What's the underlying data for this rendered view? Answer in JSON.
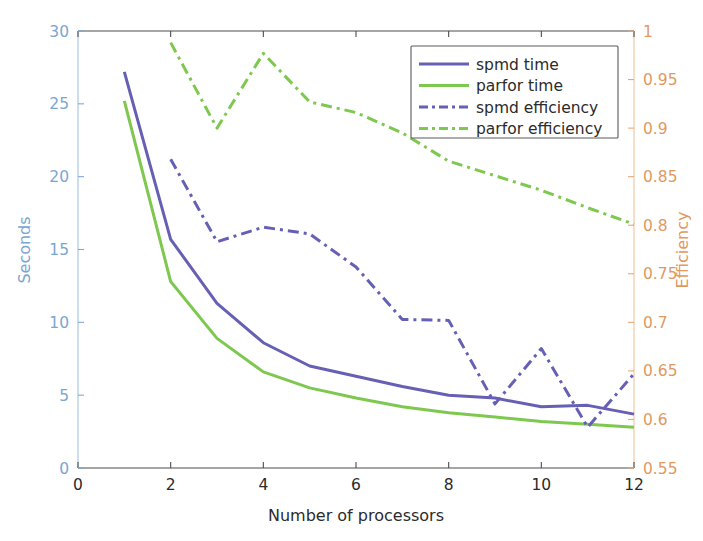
{
  "chart_data": {
    "type": "line",
    "title": "",
    "xlabel": "Number of processors",
    "ylabel": "Seconds",
    "y2label": "Efficiency",
    "xlim": [
      0,
      12
    ],
    "ylim": [
      0,
      30
    ],
    "y2lim": [
      0.55,
      1.0
    ],
    "xticks": [
      "0",
      "2",
      "4",
      "6",
      "8",
      "10",
      "12"
    ],
    "xtick_values": [
      0,
      2,
      4,
      6,
      8,
      10,
      12
    ],
    "yticks": [
      "0",
      "5",
      "10",
      "15",
      "20",
      "25",
      "30"
    ],
    "ytick_values": [
      0,
      5,
      10,
      15,
      20,
      25,
      30
    ],
    "y2ticks": [
      "0.55",
      "0.6",
      "0.65",
      "0.7",
      "0.75",
      "0.8",
      "0.85",
      "0.9",
      "0.95",
      "1"
    ],
    "y2tick_values": [
      0.55,
      0.6,
      0.65,
      0.7,
      0.75,
      0.8,
      0.85,
      0.9,
      0.95,
      1.0
    ],
    "grid": false,
    "legend_position": "top-right",
    "colors": {
      "spmd": "#6660b4",
      "parfor": "#7ec850",
      "left_axis": "#7aa6d2",
      "right_axis": "#e2995f"
    },
    "series": [
      {
        "name": "spmd time",
        "axis": "left",
        "style": "solid",
        "color": "#6660b4",
        "x": [
          1,
          2,
          3,
          4,
          5,
          6,
          7,
          8,
          9,
          10,
          11,
          12
        ],
        "values": [
          27.2,
          15.7,
          11.3,
          8.6,
          7.0,
          6.3,
          5.6,
          5.0,
          4.8,
          4.2,
          4.3,
          3.7
        ]
      },
      {
        "name": "parfor time",
        "axis": "left",
        "style": "solid",
        "color": "#7ec850",
        "x": [
          1,
          2,
          3,
          4,
          5,
          6,
          7,
          8,
          9,
          10,
          11,
          12
        ],
        "values": [
          25.2,
          12.8,
          8.9,
          6.6,
          5.5,
          4.8,
          4.2,
          3.8,
          3.5,
          3.2,
          3.0,
          2.8
        ]
      },
      {
        "name": "spmd efficiency",
        "axis": "right",
        "style": "dashdot",
        "color": "#6660b4",
        "x": [
          2,
          3,
          4,
          5,
          6,
          7,
          8,
          9,
          10,
          11,
          12
        ],
        "values": [
          0.868,
          0.783,
          0.798,
          0.791,
          0.757,
          0.703,
          0.702,
          0.616,
          0.673,
          0.592,
          0.647
        ]
      },
      {
        "name": "parfor efficiency",
        "axis": "right",
        "style": "dashdot",
        "color": "#7ec850",
        "x": [
          2,
          3,
          4,
          5,
          6,
          7,
          8,
          9,
          10,
          11,
          12
        ],
        "values": [
          0.988,
          0.9,
          0.977,
          0.927,
          0.916,
          0.895,
          0.866,
          0.851,
          0.836,
          0.818,
          0.801
        ]
      }
    ],
    "legend": [
      {
        "label": "spmd time",
        "color": "#6660b4",
        "style": "solid"
      },
      {
        "label": "parfor time",
        "color": "#7ec850",
        "style": "solid"
      },
      {
        "label": "spmd efficiency",
        "color": "#6660b4",
        "style": "dashdot"
      },
      {
        "label": "parfor efficiency",
        "color": "#7ec850",
        "style": "dashdot"
      }
    ]
  }
}
